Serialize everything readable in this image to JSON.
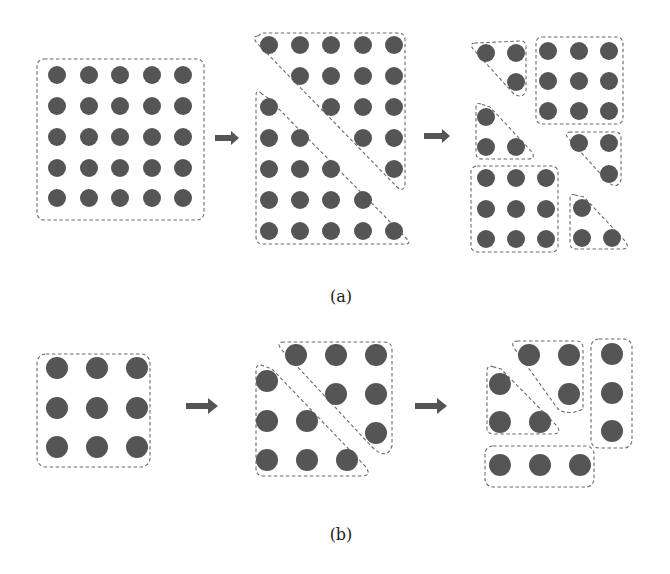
{
  "panels": [
    {
      "id": "a",
      "caption": "(a)",
      "description": "5x5 grid partitioned into two triangles, then further into squares and smaller triangles"
    },
    {
      "id": "b",
      "caption": "(b)",
      "description": "3x3 grid partitioned into two triangles, then into a smaller triangle pair and row/column strips"
    }
  ],
  "colors": {
    "dot": "#555555",
    "dashed_outline": "#6a6a6a",
    "arrow": "#555555",
    "background": "#ffffff"
  },
  "arrow_label": "right-arrow-icon"
}
